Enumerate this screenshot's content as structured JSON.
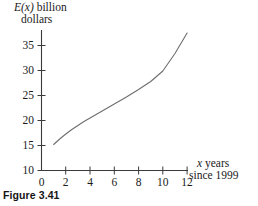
{
  "figure": {
    "caption": "Figure 3.41"
  },
  "axes": {
    "y_title_line1_prefix": "E(x)",
    "y_title_line1_suffix": " billion",
    "y_title_line2": "dollars",
    "x_title_line1_prefix": "x",
    "x_title_line1_suffix": " years",
    "x_title_line2": "since 1999"
  },
  "chart_data": {
    "type": "line",
    "title": "Figure 3.41",
    "xlabel": "x years since 1999",
    "ylabel": "E(x) billion dollars",
    "xlim": [
      0,
      12
    ],
    "ylim": [
      10,
      37.5
    ],
    "grid": false,
    "legend": null,
    "xticks": [
      0,
      2,
      4,
      6,
      8,
      10,
      12
    ],
    "xtick_labels": [
      "0",
      "2",
      "4",
      "6",
      "8",
      "10",
      "12"
    ],
    "yticks": [
      10,
      15,
      20,
      25,
      30,
      35
    ],
    "ytick_labels": [
      "10",
      "15",
      "20",
      "25",
      "30",
      "35"
    ],
    "series": [
      {
        "name": "E(x)",
        "color": "#6e6e6e",
        "x": [
          1,
          1.5,
          2,
          2.5,
          3,
          3.5,
          4,
          5,
          6,
          7,
          8,
          9,
          10,
          11,
          12
        ],
        "y": [
          15.2,
          16.3,
          17.3,
          18.2,
          19.0,
          19.8,
          20.5,
          21.9,
          23.3,
          24.7,
          26.2,
          27.8,
          29.9,
          33.4,
          37.5
        ]
      }
    ]
  },
  "colors": {
    "background": "#ffffff",
    "axis": "#3b3b3b",
    "curve": "#6e6e6e",
    "text": "#1a1a1a"
  }
}
